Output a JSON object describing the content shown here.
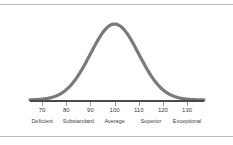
{
  "figure": {
    "background_color": "#ffffff",
    "frame": {
      "rule_color": "#b9b9b9",
      "top_rule_y": 4,
      "bottom_rule_y": 136
    }
  },
  "chart_data": {
    "type": "line",
    "title": "",
    "subtitle": "",
    "xlabel": "",
    "ylabel": "",
    "grid": false,
    "legend": null,
    "curve": {
      "name": "normal distribution",
      "color": "#7a7a7a",
      "line_width": 3.2,
      "mean": 100,
      "std_dev": 10,
      "peak_x": 100,
      "domain": [
        65,
        137
      ]
    },
    "axis": {
      "color": "#4a4a4a",
      "range": [
        65,
        137
      ],
      "tick_color": "#9a9a9a"
    },
    "x": [
      70,
      80,
      90,
      100,
      110,
      120,
      130
    ],
    "tick_labels": [
      "70",
      "80",
      "90",
      "100",
      "110",
      "120",
      "130"
    ],
    "bands": [
      {
        "label": "Deficient",
        "center": 70
      },
      {
        "label": "Substandard",
        "center": 85
      },
      {
        "label": "Average",
        "center": 100
      },
      {
        "label": "Superior",
        "center": 115
      },
      {
        "label": "Exceptional",
        "center": 130
      }
    ]
  }
}
